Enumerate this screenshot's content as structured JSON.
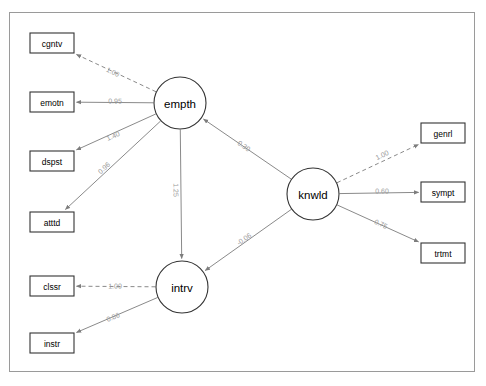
{
  "figure": {
    "title": "",
    "background_color": "#ffffff",
    "frame_color": "#9a9a9a",
    "node_stroke_color": "#333333",
    "edge_color": "#8a8a8a",
    "edge_label_color": "#999999"
  },
  "chart_data": {
    "type": "diagram",
    "diagram_kind": "sem-path-diagram",
    "title": "",
    "xlabel": "",
    "ylabel": "",
    "grid": false,
    "legend": "none",
    "nodes": [
      {
        "id": "cgntv",
        "label": "cgntv",
        "shape": "rect",
        "role": "observed",
        "x": 52,
        "y": 43
      },
      {
        "id": "emotn",
        "label": "emotn",
        "shape": "rect",
        "role": "observed",
        "x": 52,
        "y": 102
      },
      {
        "id": "dspst",
        "label": "dspst",
        "shape": "rect",
        "role": "observed",
        "x": 52,
        "y": 161
      },
      {
        "id": "atttd",
        "label": "atttd",
        "shape": "rect",
        "role": "observed",
        "x": 52,
        "y": 222
      },
      {
        "id": "clssr",
        "label": "clssr",
        "shape": "rect",
        "role": "observed",
        "x": 52,
        "y": 286
      },
      {
        "id": "instr",
        "label": "instr",
        "shape": "rect",
        "role": "observed",
        "x": 52,
        "y": 343
      },
      {
        "id": "genrl",
        "label": "genrl",
        "shape": "rect",
        "role": "observed",
        "x": 443,
        "y": 133
      },
      {
        "id": "sympt",
        "label": "sympt",
        "shape": "rect",
        "role": "observed",
        "x": 443,
        "y": 192
      },
      {
        "id": "trtmt",
        "label": "trtmt",
        "shape": "rect",
        "role": "observed",
        "x": 443,
        "y": 253
      },
      {
        "id": "empth",
        "label": "empth",
        "shape": "ellipse",
        "role": "latent",
        "x": 180,
        "y": 103
      },
      {
        "id": "intrv",
        "label": "intrv",
        "shape": "ellipse",
        "role": "latent",
        "x": 182,
        "y": 287
      },
      {
        "id": "knwld",
        "label": "knwld",
        "shape": "ellipse",
        "role": "latent",
        "x": 313,
        "y": 194
      }
    ],
    "edges": [
      {
        "from": "empth",
        "to": "cgntv",
        "label": "1.00",
        "value": 1.0,
        "style": "dashed",
        "label_x": 113,
        "label_y": 72
      },
      {
        "from": "empth",
        "to": "emotn",
        "label": "0.95",
        "value": 0.95,
        "style": "solid",
        "label_x": 115,
        "label_y": 101
      },
      {
        "from": "empth",
        "to": "dspst",
        "label": "1.40",
        "value": 1.4,
        "style": "solid",
        "label_x": 113,
        "label_y": 136
      },
      {
        "from": "empth",
        "to": "atttd",
        "label": "0.96",
        "value": 0.96,
        "style": "solid",
        "label_x": 104,
        "label_y": 168
      },
      {
        "from": "intrv",
        "to": "clssr",
        "label": "1.00",
        "value": 1.0,
        "style": "dashed",
        "label_x": 115,
        "label_y": 286
      },
      {
        "from": "intrv",
        "to": "instr",
        "label": "0.86",
        "value": 0.86,
        "style": "solid",
        "label_x": 113,
        "label_y": 317
      },
      {
        "from": "knwld",
        "to": "genrl",
        "label": "1.00",
        "value": 1.0,
        "style": "dashed",
        "label_x": 382,
        "label_y": 155
      },
      {
        "from": "knwld",
        "to": "sympt",
        "label": "0.60",
        "value": 0.6,
        "style": "solid",
        "label_x": 382,
        "label_y": 191
      },
      {
        "from": "knwld",
        "to": "trtmt",
        "label": "0.75",
        "value": 0.75,
        "style": "solid",
        "label_x": 381,
        "label_y": 224
      },
      {
        "from": "empth",
        "to": "intrv",
        "label": "1.25",
        "value": 1.25,
        "style": "solid",
        "label_x": 176,
        "label_y": 190
      },
      {
        "from": "knwld",
        "to": "empth",
        "label": "0.30",
        "value": 0.3,
        "style": "solid",
        "label_x": 244,
        "label_y": 146
      },
      {
        "from": "knwld",
        "to": "intrv",
        "label": "-0.06",
        "value": -0.06,
        "style": "solid",
        "label_x": 244,
        "label_y": 239
      }
    ]
  }
}
